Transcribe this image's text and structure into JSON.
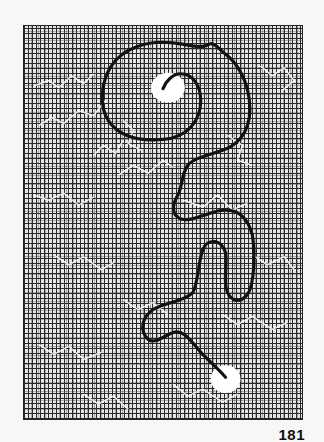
{
  "page": {
    "type": "maze-puzzle",
    "page_number": "181"
  },
  "maze": {
    "shape": "question-mark",
    "start_marker": "white-circle-top",
    "end_marker": "white-circle-bottom",
    "colors": {
      "background": "#f7f7f5",
      "maze_cells": "#e6e6e6",
      "maze_walls": "#2a2a2a",
      "solution_path": "#111111",
      "open_paths": "#ffffff"
    }
  }
}
